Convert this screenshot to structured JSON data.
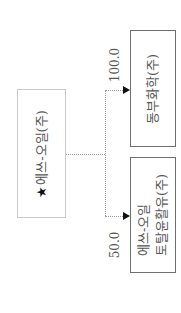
{
  "diagram": {
    "orientation": "rotated-90-ccw",
    "root": {
      "star": "★",
      "label": "에쓰-오일(주)"
    },
    "children": [
      {
        "label_lines": [
          "동부화학(주)"
        ],
        "ownership": "100.0"
      },
      {
        "label_lines": [
          "에쓰-오일",
          "토탈윤활유(주)"
        ],
        "ownership": "50.0"
      }
    ],
    "colors": {
      "root_border": "#c8c8c8",
      "child_border": "#6e6e6e",
      "connector": "#9a9a9a",
      "arrowhead": "#111111",
      "text": "#555555"
    }
  }
}
